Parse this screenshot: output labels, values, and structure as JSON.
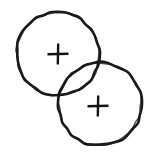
{
  "figure": {
    "title": "Two Overlapping Circles With Center Crosshairs",
    "style": "hand-drawn ink sketch",
    "background_color": "#ffffff",
    "ink_color": "#1a1a1a",
    "canvas": {
      "width": 154,
      "height": 155,
      "units": "px"
    },
    "shapes": [
      {
        "id": "circle-upper-left",
        "label": "Upper-left circle",
        "type": "circle",
        "center_x": 58,
        "center_y": 54,
        "radius": 41.5,
        "stroke_width": 2.6,
        "stroke_color": "#1a1a1a",
        "fill": "none"
      },
      {
        "id": "circle-lower-right",
        "label": "Lower-right circle",
        "type": "circle",
        "center_x": 100,
        "center_y": 104,
        "radius": 41.5,
        "stroke_width": 2.6,
        "stroke_color": "#1a1a1a",
        "fill": "none"
      }
    ],
    "markers": [
      {
        "id": "crosshair-upper-left",
        "label": "Center crosshair of upper-left circle",
        "glyph": "+",
        "center_x": 58,
        "center_y": 54,
        "arm_length": 10.5,
        "stroke_width": 2.4,
        "stroke_color": "#141414"
      },
      {
        "id": "crosshair-lower-right",
        "label": "Center crosshair of lower-right circle",
        "glyph": "+",
        "center_x": 98,
        "center_y": 106,
        "arm_length": 10.5,
        "stroke_width": 2.4,
        "stroke_color": "#141414"
      }
    ],
    "intersection": {
      "label": "Lens-shaped overlap region",
      "present": true,
      "fill": "none",
      "center_x": 79,
      "center_y": 79
    }
  }
}
